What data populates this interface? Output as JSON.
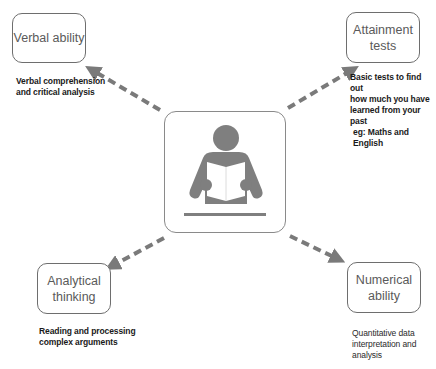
{
  "diagram": {
    "center": {
      "icon": "person-reading-book-icon"
    },
    "nodes": [
      {
        "id": "verbal",
        "label": "Verbal ability",
        "description": "Verbal comprehension and critical analysis",
        "desc_lines": [
          "Verbal comprehension",
          "and critical analysis"
        ]
      },
      {
        "id": "attainment",
        "label_lines": [
          "Attainment",
          "tests"
        ],
        "description": "Basic tests to find out how much you have learned from your past eg: Maths and English",
        "desc_lines": [
          "Basic tests to find out",
          "how much you have",
          "learned from your past",
          "eg: Maths and English"
        ]
      },
      {
        "id": "analytical",
        "label_lines": [
          "Analytical",
          "thinking"
        ],
        "description": "Reading and processing complex arguments",
        "desc_lines": [
          "Reading and processing",
          "complex arguments"
        ]
      },
      {
        "id": "numerical",
        "label_lines": [
          "Numerical",
          "ability"
        ],
        "description": "Quantitative data interpretation and analysis",
        "desc_lines": [
          "Quantitative data",
          "interpretation and",
          "analysis"
        ]
      }
    ],
    "colors": {
      "arrow": "#7a7a7a",
      "icon": "#7f7f7f",
      "border": "#6e6e6e"
    }
  }
}
